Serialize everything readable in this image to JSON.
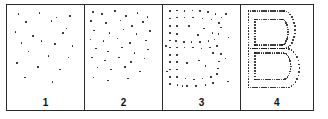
{
  "figure": {
    "name": "dot-density-letter-emergence",
    "depicted_letter": "B",
    "panel_count": 4,
    "colors": {
      "dot": "#1a1a1a",
      "border": "#2b2b2b",
      "background": "#ffffff",
      "label": "#111111"
    }
  },
  "panels": [
    {
      "label": "1",
      "density": "sparse",
      "dot_count": 22,
      "letter_visible": false,
      "dots": [
        [
          14,
          9
        ],
        [
          41,
          8
        ],
        [
          63,
          13
        ],
        [
          81,
          11
        ],
        [
          24,
          18
        ],
        [
          57,
          17
        ],
        [
          76,
          25
        ],
        [
          10,
          29
        ],
        [
          33,
          33
        ],
        [
          72,
          30
        ],
        [
          18,
          41
        ],
        [
          44,
          39
        ],
        [
          61,
          42
        ],
        [
          84,
          44
        ],
        [
          27,
          50
        ],
        [
          53,
          55
        ],
        [
          79,
          57
        ],
        [
          12,
          63
        ],
        [
          39,
          67
        ],
        [
          68,
          70
        ],
        [
          22,
          79
        ],
        [
          58,
          84
        ]
      ]
    },
    {
      "label": "2",
      "density": "low",
      "dot_count": 38,
      "letter_visible": false,
      "dots": [
        [
          9,
          7
        ],
        [
          21,
          9
        ],
        [
          38,
          6
        ],
        [
          52,
          11
        ],
        [
          67,
          8
        ],
        [
          80,
          12
        ],
        [
          7,
          17
        ],
        [
          26,
          19
        ],
        [
          45,
          16
        ],
        [
          60,
          22
        ],
        [
          74,
          18
        ],
        [
          11,
          27
        ],
        [
          31,
          30
        ],
        [
          49,
          26
        ],
        [
          66,
          31
        ],
        [
          83,
          28
        ],
        [
          6,
          37
        ],
        [
          23,
          39
        ],
        [
          41,
          36
        ],
        [
          57,
          41
        ],
        [
          78,
          38
        ],
        [
          13,
          47
        ],
        [
          29,
          50
        ],
        [
          47,
          46
        ],
        [
          63,
          52
        ],
        [
          81,
          48
        ],
        [
          8,
          57
        ],
        [
          25,
          60
        ],
        [
          43,
          57
        ],
        [
          59,
          62
        ],
        [
          76,
          58
        ],
        [
          15,
          68
        ],
        [
          33,
          70
        ],
        [
          51,
          67
        ],
        [
          70,
          72
        ],
        [
          10,
          79
        ],
        [
          29,
          82
        ],
        [
          55,
          80
        ]
      ]
    },
    {
      "label": "3",
      "density": "medium",
      "dot_count": 72,
      "letter_visible": true,
      "letter_hint": "B outline discernible among noise dots",
      "dots": [
        [
          8,
          6
        ],
        [
          17,
          5
        ],
        [
          27,
          6
        ],
        [
          37,
          5
        ],
        [
          47,
          6
        ],
        [
          57,
          7
        ],
        [
          67,
          9
        ],
        [
          75,
          13
        ],
        [
          8,
          14
        ],
        [
          17,
          13
        ],
        [
          27,
          13
        ],
        [
          38,
          13
        ],
        [
          50,
          14
        ],
        [
          62,
          15
        ],
        [
          72,
          19
        ],
        [
          8,
          22
        ],
        [
          17,
          22
        ],
        [
          74,
          24
        ],
        [
          8,
          30
        ],
        [
          17,
          31
        ],
        [
          71,
          31
        ],
        [
          8,
          38
        ],
        [
          16,
          39
        ],
        [
          26,
          40
        ],
        [
          36,
          40
        ],
        [
          47,
          40
        ],
        [
          58,
          39
        ],
        [
          66,
          37
        ],
        [
          8,
          46
        ],
        [
          17,
          46
        ],
        [
          27,
          46
        ],
        [
          38,
          46
        ],
        [
          49,
          47
        ],
        [
          60,
          46
        ],
        [
          69,
          44
        ],
        [
          8,
          54
        ],
        [
          17,
          54
        ],
        [
          64,
          52
        ],
        [
          74,
          53
        ],
        [
          8,
          62
        ],
        [
          17,
          62
        ],
        [
          72,
          61
        ],
        [
          8,
          70
        ],
        [
          17,
          70
        ],
        [
          70,
          69
        ],
        [
          8,
          78
        ],
        [
          17,
          78
        ],
        [
          28,
          80
        ],
        [
          39,
          81
        ],
        [
          50,
          80
        ],
        [
          61,
          78
        ],
        [
          69,
          75
        ],
        [
          8,
          86
        ],
        [
          18,
          87
        ],
        [
          30,
          88
        ],
        [
          42,
          88
        ],
        [
          54,
          87
        ],
        [
          64,
          85
        ],
        [
          33,
          22
        ],
        [
          52,
          25
        ],
        [
          30,
          63
        ],
        [
          54,
          66
        ],
        [
          81,
          9
        ],
        [
          84,
          35
        ],
        [
          80,
          58
        ],
        [
          83,
          83
        ],
        [
          3,
          44
        ],
        [
          4,
          72
        ],
        [
          44,
          32
        ],
        [
          46,
          60
        ],
        [
          24,
          88
        ],
        [
          63,
          30
        ]
      ]
    },
    {
      "label": "4",
      "density": "high",
      "dot_count": 160,
      "letter_visible": true,
      "letter_hint": "B rendered as a dense dotted outline with inner counters"
    }
  ],
  "letter_outline": {
    "stem_x": 9,
    "top_y": 6,
    "bottom_y": 90,
    "upper_bowl_right": 72,
    "lower_bowl_right": 78,
    "waist_y": 47,
    "inner_inset": 9
  }
}
